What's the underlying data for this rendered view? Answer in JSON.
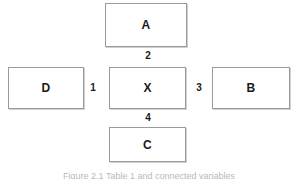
{
  "figure": {
    "type": "node-link-diagram",
    "background_color": "#ffffff",
    "box_border_color": "#9a9a9a",
    "text_color": "#1a1a1a",
    "caption": "Figure 2.1   Table 1 and connected variables"
  },
  "nodes": [
    {
      "id": "a",
      "label": "A",
      "position": "top"
    },
    {
      "id": "d",
      "label": "D",
      "position": "left"
    },
    {
      "id": "x",
      "label": "X",
      "position": "center"
    },
    {
      "id": "b",
      "label": "B",
      "position": "right"
    },
    {
      "id": "c",
      "label": "C",
      "position": "bottom"
    }
  ],
  "edges": [
    {
      "id": "edge1",
      "label": "1",
      "from": "d",
      "to": "x",
      "orientation": "horizontal"
    },
    {
      "id": "edge2",
      "label": "2",
      "from": "a",
      "to": "x",
      "orientation": "vertical"
    },
    {
      "id": "edge3",
      "label": "3",
      "from": "x",
      "to": "b",
      "orientation": "horizontal"
    },
    {
      "id": "edge4",
      "label": "4",
      "from": "x",
      "to": "c",
      "orientation": "vertical"
    }
  ]
}
